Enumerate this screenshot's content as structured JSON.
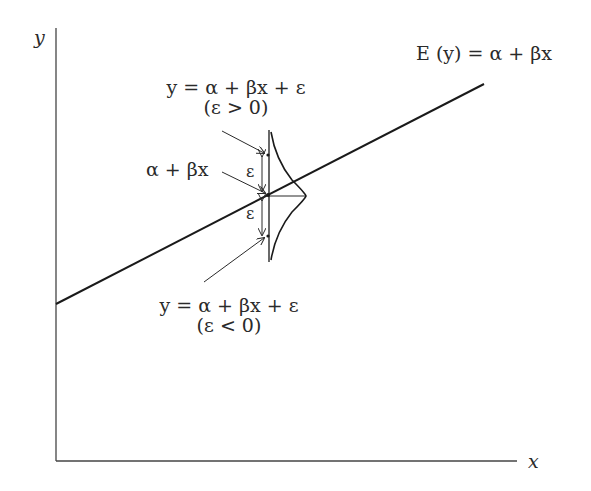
{
  "diagram": {
    "type": "linear-regression-model",
    "axes": {
      "x_label": "x",
      "y_label": "y"
    },
    "regression_line_label": "E (y) = α + βx",
    "mean_point_label": "α + βx",
    "upper_point": {
      "equation": "y = α + βx + ε",
      "condition": "(ε > 0)"
    },
    "lower_point": {
      "equation": "y = α + βx + ε",
      "condition": "(ε < 0)"
    },
    "error_labels": [
      "ε",
      "ε"
    ],
    "colors": {
      "line": "#1a1a1a",
      "text": "#2a2a2a",
      "background": "#ffffff"
    }
  }
}
